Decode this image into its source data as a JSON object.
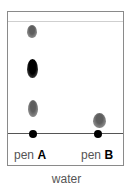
{
  "diagram": {
    "type": "paper chromatography",
    "solvent_label": "water",
    "colors": {
      "grey_spot": "#6a6a6a",
      "black_spot": "#000000",
      "border": "#8a8a8a"
    },
    "lanes": [
      {
        "prefix": "pen",
        "letter": "A",
        "spots": [
          {
            "shade": "grey",
            "position": "top"
          },
          {
            "shade": "black",
            "position": "upper-middle"
          },
          {
            "shade": "grey",
            "position": "lower"
          }
        ]
      },
      {
        "prefix": "pen",
        "letter": "B",
        "spots": [
          {
            "shade": "grey",
            "position": "just above baseline"
          }
        ]
      }
    ]
  }
}
